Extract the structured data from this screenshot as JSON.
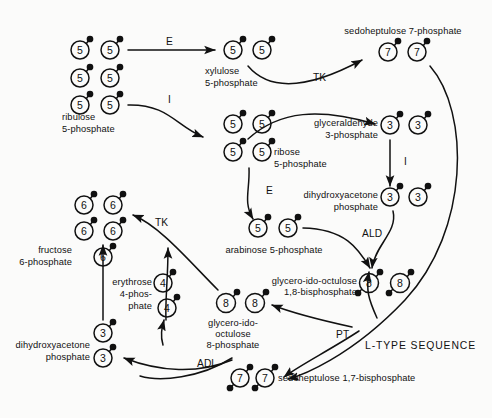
{
  "figure": {
    "title": "L-TYPE SEQUENCE",
    "ink_color": "#111111",
    "background_color": "#fbfbfa"
  },
  "metabolites": [
    {
      "id": "ribulose5p",
      "name": "ribulose\n5-phosphate",
      "carbons": "5",
      "count": 6,
      "phosphates": 1
    },
    {
      "id": "xylulose5p",
      "name": "xylulose\n5-phosphate",
      "carbons": "5",
      "count": 2,
      "phosphates": 1
    },
    {
      "id": "ribose5p",
      "name": "ribose\n5-phosphate",
      "carbons": "5",
      "count": 4,
      "phosphates": 1
    },
    {
      "id": "sedo7p",
      "name": "sedoheptulose 7-phosphate",
      "carbons": "7",
      "count": 2,
      "phosphates": 1
    },
    {
      "id": "gap3p",
      "name": "glyceraldehyde\n3-phosphate",
      "carbons": "3",
      "count": 2,
      "phosphates": 1
    },
    {
      "id": "dhap_mid",
      "name": "dihydroxyacetone\nphosphate",
      "carbons": "3",
      "count": 2,
      "phosphates": 1
    },
    {
      "id": "arabinose5p",
      "name": "arabinose 5-phosphate",
      "carbons": "5",
      "count": 2,
      "phosphates": 1
    },
    {
      "id": "octulose18",
      "name": "glycero-ido-octulose\n1,8-bisphosphate",
      "carbons": "8",
      "count": 2,
      "phosphates": 2
    },
    {
      "id": "octulose8",
      "name": "glycero-ido-\noctulose\n8-phosphate",
      "carbons": "8",
      "count": 2,
      "phosphates": 1
    },
    {
      "id": "fructose6p",
      "name": "fructose\n6-phosphate",
      "carbons": "6",
      "count": 5,
      "phosphates": 1
    },
    {
      "id": "erythrose4p",
      "name": "erythrose\n4-phos-\nphate",
      "carbons": "4",
      "count": 2,
      "phosphates": 1
    },
    {
      "id": "dhap_low",
      "name": "dihydroxyacetone\nphosphate",
      "carbons": "3",
      "count": 2,
      "phosphates": 1
    },
    {
      "id": "sedo17",
      "name": "sedoheptulose 1,7-bisphosphate",
      "carbons": "7",
      "count": 2,
      "phosphates": 2
    }
  ],
  "labels": {
    "ribulose5p_l1": "ribulose",
    "ribulose5p_l2": "5-phosphate",
    "xylulose5p_l1": "xylulose",
    "xylulose5p_l2": "5-phosphate",
    "ribose5p_l1": "ribose",
    "ribose5p_l2": "5-phosphate",
    "sedo7p": "sedoheptulose 7-phosphate",
    "gap3p_l1": "glyceraldehyde",
    "gap3p_l2": "3-phosphate",
    "dhap_mid_l1": "dihydroxyacetone",
    "dhap_mid_l2": "phosphate",
    "arabinose5p": "arabinose 5-phosphate",
    "octulose18_l1": "glycero-ido-octulose",
    "octulose18_l2": "1,8-bisphosphate",
    "octulose8_l1": "glycero-ido-",
    "octulose8_l2": "octulose",
    "octulose8_l3": "8-phosphate",
    "fructose6p_l1": "fructose",
    "fructose6p_l2": "6-phosphate",
    "erythrose4p_l1": "erythrose",
    "erythrose4p_l2": "4-phos-",
    "erythrose4p_l3": "phate",
    "dhap_low_l1": "dihydroxyacetone",
    "dhap_low_l2": "phosphate",
    "sedo17": "sedoheptulose 1,7-bisphosphate",
    "sequence_title": "L-TYPE SEQUENCE"
  },
  "enzymes": [
    {
      "id": "E_top",
      "label": "E",
      "full": "epimerase"
    },
    {
      "id": "I_top",
      "label": "I",
      "full": "isomerase"
    },
    {
      "id": "TK_top",
      "label": "TK",
      "full": "transketolase"
    },
    {
      "id": "I_mid",
      "label": "I",
      "full": "isomerase"
    },
    {
      "id": "E_mid",
      "label": "E",
      "full": "epimerase"
    },
    {
      "id": "ALD",
      "label": "ALD",
      "full": "aldolase"
    },
    {
      "id": "TK_low",
      "label": "TK",
      "full": "transketolase"
    },
    {
      "id": "PT",
      "label": "PT",
      "full": "phosphotransferase"
    },
    {
      "id": "ADL",
      "label": "ADL",
      "full": "aldolase"
    }
  ],
  "circle_values": {
    "c3": "3",
    "c4": "4",
    "c5": "5",
    "c6": "6",
    "c7": "7",
    "c8": "8"
  }
}
